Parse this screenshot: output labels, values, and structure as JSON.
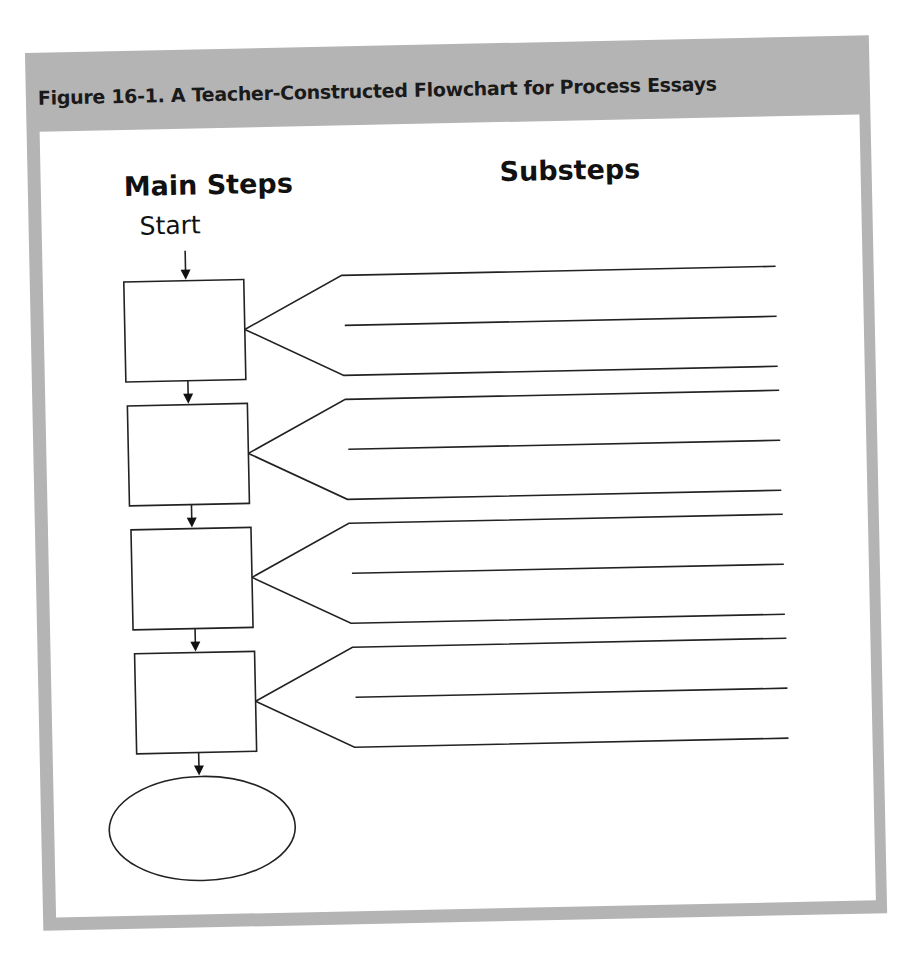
{
  "figure": {
    "title": "Figure 16-1. A Teacher-Constructed Flowchart for Process Essays",
    "frame_color": "#b4b4b4",
    "panel_color": "#ffffff",
    "ink_color": "#222222"
  },
  "columns": {
    "main_steps_heading": "Main Steps",
    "substeps_heading": "Substeps"
  },
  "flow": {
    "start_label": "Start",
    "main_step_boxes": [
      {
        "index": 1,
        "label": "",
        "substep_lines": 3
      },
      {
        "index": 2,
        "label": "",
        "substep_lines": 3
      },
      {
        "index": 3,
        "label": "",
        "substep_lines": 3
      },
      {
        "index": 4,
        "label": "",
        "substep_lines": 3
      }
    ],
    "end_oval": {
      "label": ""
    }
  }
}
